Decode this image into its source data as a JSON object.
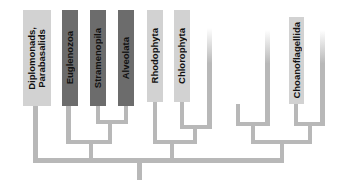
{
  "diagram": {
    "type": "phylogenetic-tree",
    "taxa": [
      {
        "label": "Diplomonads,\nParabasalids",
        "shade": "light"
      },
      {
        "label": "Euglenozoa",
        "shade": "dark"
      },
      {
        "label": "Stramenopila",
        "shade": "dark"
      },
      {
        "label": "Alveolata",
        "shade": "dark"
      },
      {
        "label": "Rhodophyta",
        "shade": "light"
      },
      {
        "label": "Chlorophyta",
        "shade": "light"
      },
      {
        "label": "Choanoflagellida",
        "shade": "light"
      }
    ],
    "colors": {
      "light_box": "#d2d2d2",
      "dark_box": "#6c6c6c",
      "branch": "#b8b8b8",
      "text": "#111111"
    }
  }
}
